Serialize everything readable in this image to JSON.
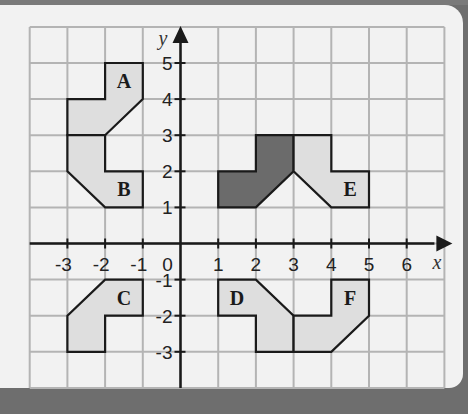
{
  "diagram": {
    "type": "coordinate-grid-transformations",
    "x_range": [
      -4,
      7
    ],
    "y_range": [
      -4,
      6
    ],
    "axis_labels": {
      "x": "x",
      "y": "y"
    },
    "x_tick_labels": [
      "-3",
      "-2",
      "-1",
      "0",
      "1",
      "2",
      "3",
      "4",
      "5",
      "6"
    ],
    "y_tick_labels": [
      "5",
      "4",
      "3",
      "2",
      "1",
      "-1",
      "-2",
      "-3"
    ],
    "origin_label": "0",
    "colors": {
      "panel": "#f2f2f2",
      "frame": "#6e6e6e",
      "grid": "#b4b4b4",
      "axis": "#1a1a1a",
      "shape_light": "#dedede",
      "shape_dark": "#6b6b6b",
      "outline": "#1a1a1a"
    },
    "shapes": [
      {
        "id": "object",
        "label": "",
        "fill": "dark",
        "points": [
          [
            1,
            2
          ],
          [
            2,
            2
          ],
          [
            2,
            3
          ],
          [
            3,
            3
          ],
          [
            3,
            2
          ],
          [
            2,
            1
          ],
          [
            1,
            1
          ]
        ]
      },
      {
        "id": "A",
        "label": "A",
        "fill": "light",
        "label_at": [
          -1.5,
          4.5
        ],
        "points": [
          [
            -2,
            5
          ],
          [
            -1,
            5
          ],
          [
            -1,
            4
          ],
          [
            -2,
            3
          ],
          [
            -3,
            3
          ],
          [
            -3,
            4
          ],
          [
            -2,
            4
          ]
        ]
      },
      {
        "id": "B",
        "label": "B",
        "fill": "light",
        "label_at": [
          -1.5,
          1.5
        ],
        "points": [
          [
            -3,
            3
          ],
          [
            -2,
            3
          ],
          [
            -2,
            2
          ],
          [
            -1,
            2
          ],
          [
            -1,
            1
          ],
          [
            -2,
            1
          ],
          [
            -3,
            2
          ]
        ]
      },
      {
        "id": "C",
        "label": "C",
        "fill": "light",
        "label_at": [
          -1.5,
          -1.5
        ],
        "points": [
          [
            -2,
            -1
          ],
          [
            -1,
            -1
          ],
          [
            -1,
            -2
          ],
          [
            -2,
            -2
          ],
          [
            -2,
            -3
          ],
          [
            -3,
            -3
          ],
          [
            -3,
            -2
          ]
        ]
      },
      {
        "id": "D",
        "label": "D",
        "fill": "light",
        "label_at": [
          1.5,
          -1.5
        ],
        "points": [
          [
            1,
            -1
          ],
          [
            2,
            -1
          ],
          [
            3,
            -2
          ],
          [
            3,
            -3
          ],
          [
            2,
            -3
          ],
          [
            2,
            -2
          ],
          [
            1,
            -2
          ]
        ]
      },
      {
        "id": "E",
        "label": "E",
        "fill": "light",
        "label_at": [
          4.5,
          1.5
        ],
        "points": [
          [
            3,
            3
          ],
          [
            4,
            3
          ],
          [
            4,
            2
          ],
          [
            5,
            2
          ],
          [
            5,
            1
          ],
          [
            4,
            1
          ],
          [
            3,
            2
          ]
        ]
      },
      {
        "id": "F",
        "label": "F",
        "fill": "light",
        "label_at": [
          4.5,
          -1.5
        ],
        "points": [
          [
            4,
            -1
          ],
          [
            5,
            -1
          ],
          [
            5,
            -2
          ],
          [
            4,
            -3
          ],
          [
            3,
            -3
          ],
          [
            3,
            -2
          ],
          [
            4,
            -2
          ]
        ]
      }
    ]
  }
}
